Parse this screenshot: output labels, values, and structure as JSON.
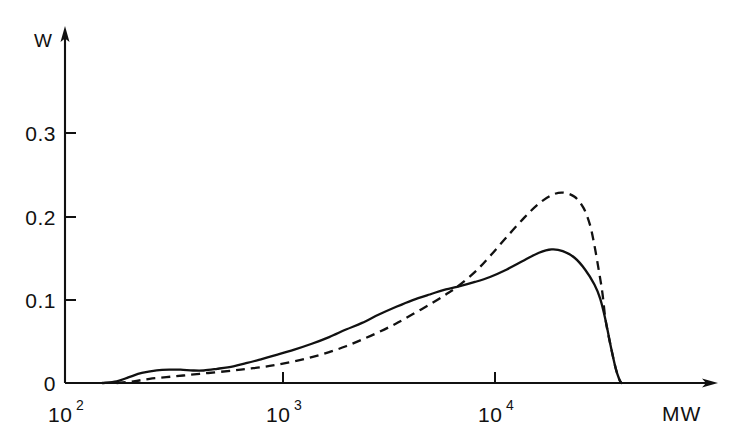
{
  "chart_data": {
    "type": "line",
    "title": "",
    "subtitle": "",
    "xlabel": "MW",
    "ylabel": "W",
    "xscale": "log",
    "yscale": "linear",
    "xlim": [
      100,
      100000
    ],
    "ylim": [
      0,
      0.355
    ],
    "grid": false,
    "legend": "none",
    "xticks": [
      {
        "value": 100,
        "label": "10",
        "exponent": "2"
      },
      {
        "value": 1000,
        "label": "10",
        "exponent": "3"
      },
      {
        "value": 10000,
        "label": "10",
        "exponent": "4"
      }
    ],
    "yticks": [
      {
        "value": 0,
        "label": "0"
      },
      {
        "value": 0.1,
        "label": "0.1"
      },
      {
        "value": 0.2,
        "label": "0.2"
      },
      {
        "value": 0.3,
        "label": "0.3"
      }
    ],
    "series": [
      {
        "name": "solid-curve",
        "style": "solid",
        "color": "#111111",
        "points": [
          [
            150,
            0.0
          ],
          [
            175,
            0.002
          ],
          [
            200,
            0.007
          ],
          [
            230,
            0.012
          ],
          [
            270,
            0.015
          ],
          [
            310,
            0.016
          ],
          [
            350,
            0.016
          ],
          [
            400,
            0.015
          ],
          [
            450,
            0.015
          ],
          [
            520,
            0.017
          ],
          [
            620,
            0.02
          ],
          [
            720,
            0.024
          ],
          [
            850,
            0.029
          ],
          [
            1000,
            0.034
          ],
          [
            1200,
            0.04
          ],
          [
            1450,
            0.047
          ],
          [
            1750,
            0.055
          ],
          [
            2100,
            0.064
          ],
          [
            2500,
            0.072
          ],
          [
            3000,
            0.082
          ],
          [
            3600,
            0.091
          ],
          [
            4300,
            0.099
          ],
          [
            5200,
            0.106
          ],
          [
            6200,
            0.112
          ],
          [
            7000,
            0.115
          ],
          [
            8500,
            0.121
          ],
          [
            10000,
            0.127
          ],
          [
            12000,
            0.136
          ],
          [
            14500,
            0.147
          ],
          [
            17000,
            0.156
          ],
          [
            19500,
            0.16
          ],
          [
            22000,
            0.158
          ],
          [
            25000,
            0.15
          ],
          [
            28000,
            0.136
          ],
          [
            31000,
            0.118
          ],
          [
            33000,
            0.101
          ],
          [
            35000,
            0.075
          ],
          [
            37000,
            0.044
          ],
          [
            39000,
            0.018
          ],
          [
            40500,
            0.005
          ],
          [
            41500,
            0.0
          ]
        ]
      },
      {
        "name": "dashed-curve",
        "style": "dashed",
        "color": "#111111",
        "points": [
          [
            175,
            0.0
          ],
          [
            210,
            0.002
          ],
          [
            250,
            0.005
          ],
          [
            300,
            0.007
          ],
          [
            360,
            0.009
          ],
          [
            430,
            0.011
          ],
          [
            520,
            0.013
          ],
          [
            620,
            0.015
          ],
          [
            720,
            0.017
          ],
          [
            850,
            0.019
          ],
          [
            1000,
            0.022
          ],
          [
            1200,
            0.026
          ],
          [
            1450,
            0.031
          ],
          [
            1750,
            0.037
          ],
          [
            2100,
            0.044
          ],
          [
            2500,
            0.052
          ],
          [
            3000,
            0.061
          ],
          [
            3600,
            0.071
          ],
          [
            4300,
            0.082
          ],
          [
            5200,
            0.094
          ],
          [
            6200,
            0.106
          ],
          [
            7000,
            0.115
          ],
          [
            8500,
            0.133
          ],
          [
            10000,
            0.152
          ],
          [
            12000,
            0.175
          ],
          [
            14500,
            0.198
          ],
          [
            17000,
            0.215
          ],
          [
            19500,
            0.225
          ],
          [
            22000,
            0.228
          ],
          [
            25000,
            0.223
          ],
          [
            27500,
            0.21
          ],
          [
            29500,
            0.19
          ],
          [
            31000,
            0.165
          ],
          [
            32500,
            0.135
          ],
          [
            33800,
            0.108
          ],
          [
            35000,
            0.075
          ],
          [
            37000,
            0.044
          ],
          [
            39000,
            0.018
          ],
          [
            40500,
            0.005
          ],
          [
            41500,
            0.0
          ]
        ]
      }
    ],
    "annotations": [],
    "axis_arrows": {
      "x": "right",
      "y": "up"
    }
  }
}
